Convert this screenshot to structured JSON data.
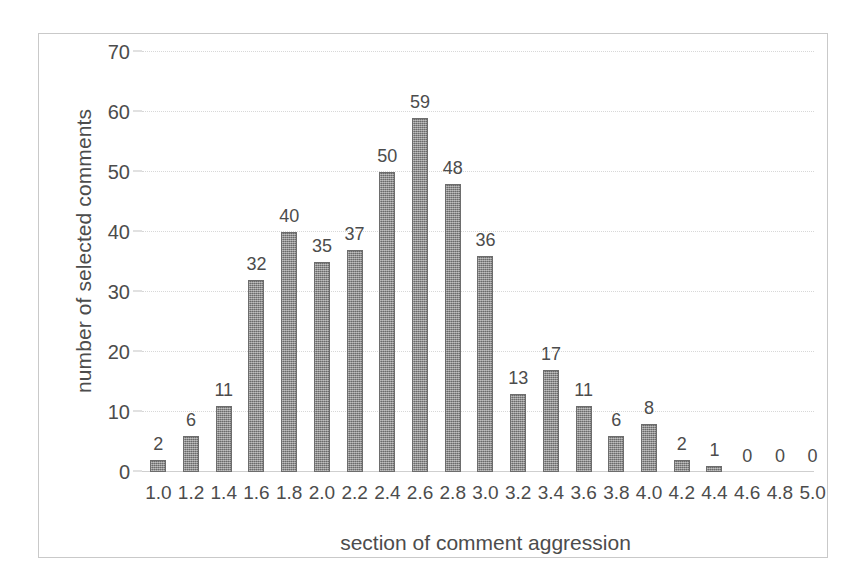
{
  "chart_data": {
    "type": "bar",
    "title": "",
    "xlabel": "section of comment aggression",
    "ylabel": "number of selected comments",
    "categories": [
      "1.0",
      "1.2",
      "1.4",
      "1.6",
      "1.8",
      "2.0",
      "2.2",
      "2.4",
      "2.6",
      "2.8",
      "3.0",
      "3.2",
      "3.4",
      "3.6",
      "3.8",
      "4.0",
      "4.2",
      "4.4",
      "4.6",
      "4.8",
      "5.0"
    ],
    "values": [
      2,
      6,
      11,
      32,
      40,
      35,
      37,
      50,
      59,
      48,
      36,
      13,
      17,
      11,
      6,
      8,
      2,
      1,
      0,
      0,
      0
    ],
    "data_labels": [
      "2",
      "6",
      "11",
      "32",
      "40",
      "35",
      "37",
      "50",
      "59",
      "48",
      "36",
      "13",
      "17",
      "11",
      "6",
      "8",
      "2",
      "1",
      "0",
      "0",
      "0"
    ],
    "ylim": [
      0,
      70
    ],
    "yticks": [
      0,
      10,
      20,
      30,
      40,
      50,
      60,
      70
    ],
    "ytick_labels": [
      "0",
      "10",
      "20",
      "30",
      "40",
      "50",
      "60",
      "70"
    ],
    "grid": true,
    "legend": "none",
    "bar_color": "#8a8a8a",
    "bar_edge_color": "#6d6d6d",
    "grid_color": "#d8d8d8",
    "text_color": "#4c4c4c",
    "frame_color": "#c9c9c9",
    "background": "#ffffff"
  }
}
